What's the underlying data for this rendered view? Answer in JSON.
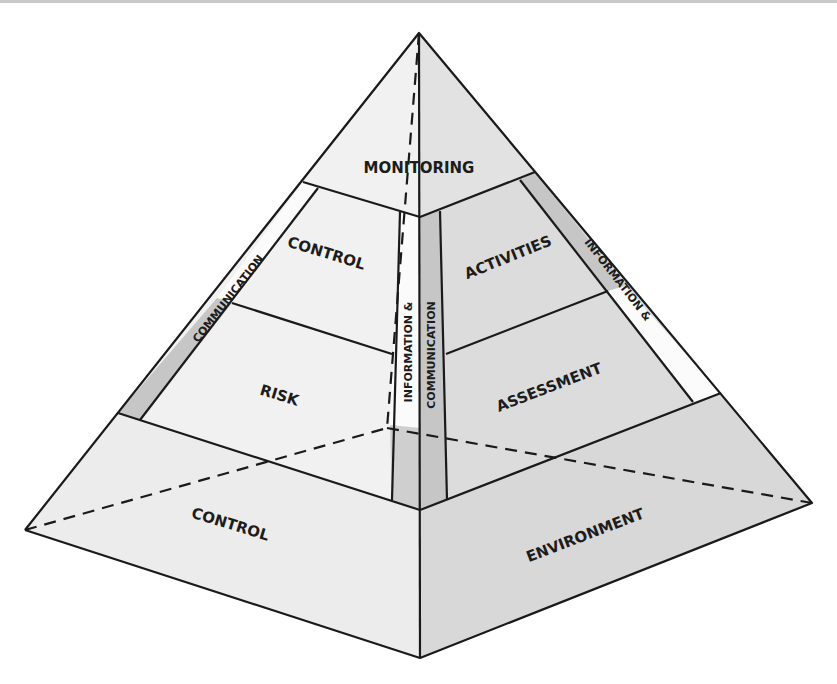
{
  "diagram": {
    "title": "",
    "type": "pyramid",
    "colors": {
      "left_face": "#f1f1f1",
      "right_face": "#dcdcdc",
      "strip_gray": "#c6c6c6",
      "strip_white": "#fbfbfb",
      "edge": "#1a1a1a"
    },
    "labels": {
      "monitoring": "MONITORING",
      "control_upper": "CONTROL",
      "activities": "ACTIVITIES",
      "risk": "RISK",
      "assessment": "ASSESSMENT",
      "control_base": "CONTROL",
      "environment": "ENVIRONMENT",
      "left_strip": "COMMUNICATION",
      "right_strip": "INFORMATION &",
      "center_left_strip": "INFORMATION &",
      "center_right_strip": "COMMUNICATION"
    },
    "layers": [
      {
        "level": 1,
        "name": "Monitoring"
      },
      {
        "level": 2,
        "name": "Control Activities"
      },
      {
        "level": 3,
        "name": "Risk Assessment"
      },
      {
        "level": 4,
        "name": "Control Environment"
      }
    ],
    "side_bands": [
      "Information & Communication"
    ]
  }
}
